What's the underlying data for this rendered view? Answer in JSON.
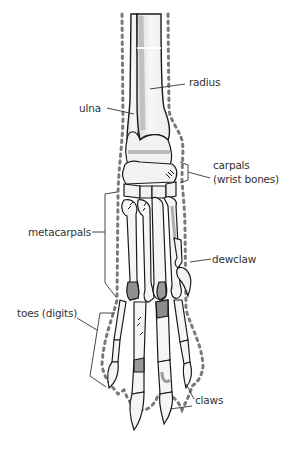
{
  "diagram": {
    "colors": {
      "outline": "#1a1a1a",
      "bone_fill": "#f4f4f4",
      "shade": "#9a9a9a",
      "dotted_outline": "#7a7a7a",
      "label_text": "#333333"
    },
    "labels": {
      "radius": "radius",
      "ulna": "ulna",
      "carpals": "carpals",
      "carpals_sub": "(wrist bones)",
      "metacarpals": "metacarpals",
      "dewclaw": "dewclaw",
      "toes": "toes (digits)",
      "claws": "claws"
    }
  }
}
